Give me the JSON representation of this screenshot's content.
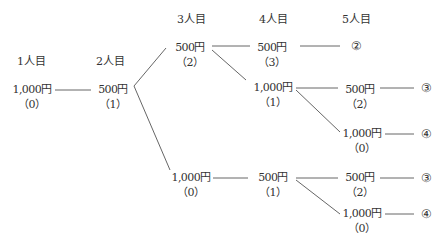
{
  "headers": [
    "1人目",
    "2人目",
    "3人目",
    "4人目",
    "5人目"
  ],
  "nodes": {
    "p1": {
      "amount": "1,000円",
      "count": "（0）"
    },
    "p2": {
      "amount": "500円",
      "count": "（1）"
    },
    "p3a": {
      "amount": "500円",
      "count": "（2）"
    },
    "p3b": {
      "amount": "1,000円",
      "count": "（0）"
    },
    "p4a": {
      "amount": "500円",
      "count": "（3）"
    },
    "p4b": {
      "amount": "1,000円",
      "count": "（1）"
    },
    "p4c": {
      "amount": "500円",
      "count": "（1）"
    },
    "p5a": {
      "amount": "500円",
      "count": "（2）"
    },
    "p5b": {
      "amount": "1,000円",
      "count": "（0）"
    },
    "p5c": {
      "amount": "500円",
      "count": "（2）"
    },
    "p5d": {
      "amount": "1,000円",
      "count": "（0）"
    }
  },
  "outcomes": [
    "②",
    "③",
    "④",
    "③",
    "④"
  ]
}
